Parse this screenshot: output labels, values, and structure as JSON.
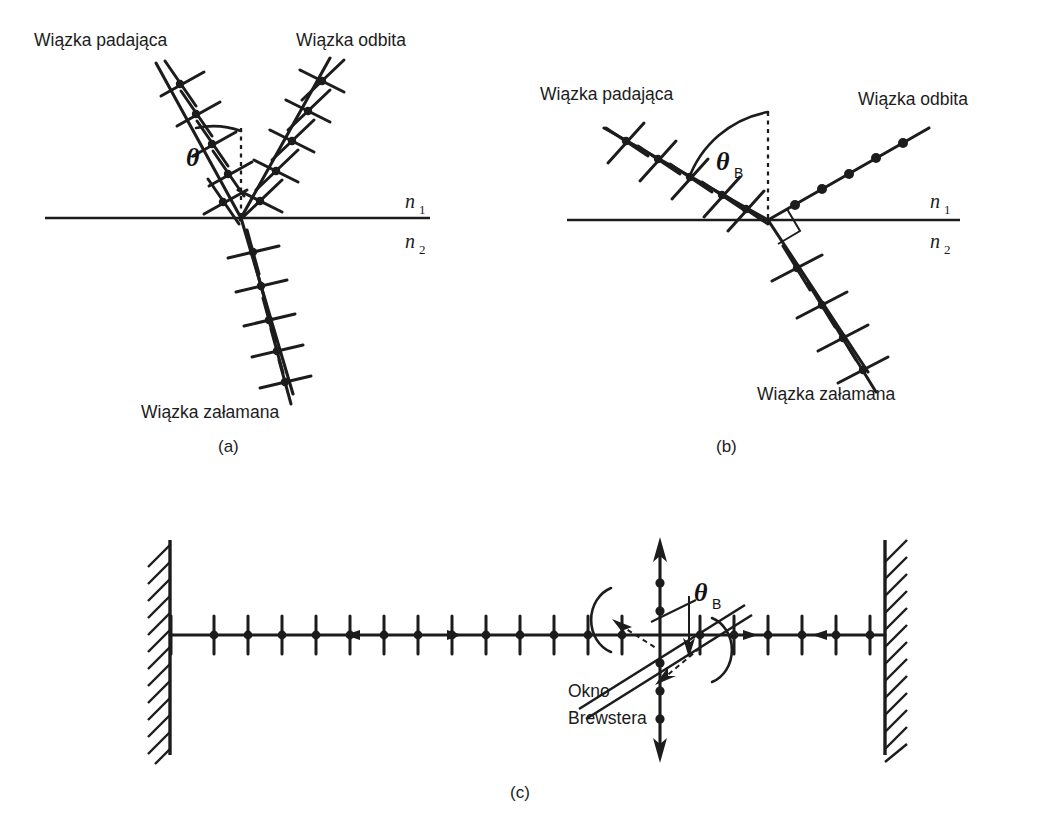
{
  "figure": {
    "background_color": "#ffffff",
    "ink_color": "#1c1c1c",
    "width": 1044,
    "height": 840
  },
  "panels": [
    {
      "id": "a",
      "caption": "(a)",
      "caption_x": 218,
      "caption_y": 452,
      "description": "Odbicie i zalamanie swiatla niespolaryzowanego pod dowolnym katem padania",
      "labels": {
        "incident": "Wiązka padająca",
        "reflected": "Wiązka odbita",
        "refracted": "Wiązka załamana",
        "n_upper": "n",
        "n_upper_sub": "1",
        "n_lower": "n",
        "n_lower_sub": "2",
        "angle": "θ",
        "angle_sub": ""
      },
      "label_positions": {
        "incident": {
          "x": 34,
          "y": 46
        },
        "reflected": {
          "x": 296,
          "y": 46
        },
        "refracted": {
          "x": 141,
          "y": 418
        },
        "n_upper": {
          "x": 405,
          "y": 207
        },
        "n_lower": {
          "x": 405,
          "y": 246
        },
        "angle": {
          "x": 186,
          "y": 158
        }
      },
      "geometry": {
        "interface_y": 218,
        "interface_x1": 45,
        "interface_x2": 430,
        "origin_x": 241,
        "origin_y": 218,
        "normal_top_y": 128,
        "incident_tip": {
          "x": 156,
          "y": 63
        },
        "reflected_tip": {
          "x": 330,
          "y": 58
        },
        "refracted_tip": {
          "x": 293,
          "y": 394
        },
        "arc_radius": 78
      },
      "polarization": {
        "incident": "unpolarized",
        "reflected": "unpolarized",
        "refracted": "unpolarized"
      }
    },
    {
      "id": "b",
      "caption": "(b)",
      "caption_x": 716,
      "caption_y": 452,
      "description": "Odbicie pod katem Brewstera - wiazka odbita calkowicie spolaryzowana prostopadle do plaszczyzny padania",
      "labels": {
        "incident": "Wiązka padająca",
        "reflected": "Wiązka odbita",
        "refracted": "Wiązka załamana",
        "n_upper": "n",
        "n_upper_sub": "1",
        "n_lower": "n",
        "n_lower_sub": "2",
        "angle": "θ",
        "angle_sub": "B"
      },
      "label_positions": {
        "incident": {
          "x": 540,
          "y": 100
        },
        "reflected": {
          "x": 858,
          "y": 105
        },
        "refracted": {
          "x": 757,
          "y": 400
        },
        "n_upper": {
          "x": 930,
          "y": 207
        },
        "n_lower": {
          "x": 930,
          "y": 246
        },
        "angle": {
          "x": 723,
          "y": 160
        }
      },
      "geometry": {
        "interface_y": 220,
        "interface_x1": 567,
        "interface_x2": 960,
        "origin_x": 768,
        "origin_y": 220,
        "normal_top_y": 112,
        "incident_tip": {
          "x": 604,
          "y": 128
        },
        "reflected_tip": {
          "x": 929,
          "y": 128
        },
        "refracted_tip": {
          "x": 868,
          "y": 372
        },
        "arc_radius": 96,
        "right_angle_size": 18
      },
      "polarization": {
        "incident": "unpolarized",
        "reflected": "s-polarized (dots only)",
        "refracted": "partially polarized"
      }
    },
    {
      "id": "c",
      "caption": "(c)",
      "caption_x": 510,
      "caption_y": 798,
      "description": "Okno Brewstera w rezonatorze lasera",
      "labels": {
        "window_line1": "Okno",
        "window_line2": "Brewstera",
        "angle": "θ",
        "angle_sub": "B"
      },
      "label_positions": {
        "window_line1": {
          "x": 568,
          "y": 694
        },
        "window_line2": {
          "x": 568,
          "y": 721
        },
        "angle": {
          "x": 700,
          "y": 592
        }
      },
      "geometry": {
        "axis_y": 635,
        "mirror_left_x": 170,
        "mirror_right_x": 885,
        "mirror_top_y": 540,
        "mirror_bottom_y": 755,
        "window_center_x": 660,
        "window_angle_deg": -32,
        "window_half_length": 105,
        "vertical_beam_top_y": 540,
        "vertical_beam_bottom_y": 760,
        "tick_count_left": 16,
        "tick_count_right": 6,
        "tick_half_height": 19
      }
    }
  ],
  "legend_notes": {
    "tick_meaning": "kreski = polaryzacja w plaszczyznie rysunku",
    "dot_meaning": "kropki = polaryzacja prostopadla do plaszczyzny rysunku"
  }
}
